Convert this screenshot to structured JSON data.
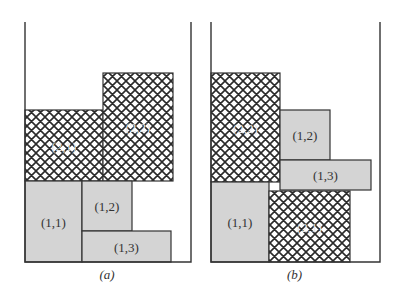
{
  "colors": {
    "gray_fill": "#d4d4d4",
    "stroke": "#333333",
    "hatch": "#2a2a2a",
    "background": "#ffffff"
  },
  "panels": [
    {
      "caption": "(a)",
      "container": {
        "left": 25,
        "right": 191,
        "top": 22,
        "bottom": 262
      },
      "blocks": [
        {
          "label": "(2,1)",
          "pattern": "crosshatch",
          "x": 25,
          "y": 110,
          "w": 78,
          "h": 71
        },
        {
          "label": "(2,2)",
          "pattern": "crosshatch",
          "x": 103,
          "y": 73,
          "w": 70,
          "h": 108
        },
        {
          "label": "(1,1)",
          "pattern": "gray",
          "x": 25,
          "y": 181,
          "w": 57,
          "h": 81
        },
        {
          "label": "(1,2)",
          "pattern": "gray",
          "x": 82,
          "y": 181,
          "w": 50,
          "h": 50
        },
        {
          "label": "(1,3)",
          "pattern": "gray",
          "x": 82,
          "y": 231,
          "w": 89,
          "h": 31
        }
      ]
    },
    {
      "caption": "(b)",
      "container": {
        "left": 211,
        "right": 380,
        "top": 22,
        "bottom": 262
      },
      "blocks": [
        {
          "label": "(2,2)",
          "pattern": "crosshatch",
          "x": 211,
          "y": 73,
          "w": 69,
          "h": 109
        },
        {
          "label": "(1,2)",
          "pattern": "gray",
          "x": 280,
          "y": 110,
          "w": 50,
          "h": 50
        },
        {
          "label": "(1,3)",
          "pattern": "gray",
          "x": 280,
          "y": 160,
          "w": 91,
          "h": 30
        },
        {
          "label": "(1,1)",
          "pattern": "gray",
          "x": 211,
          "y": 182,
          "w": 58,
          "h": 80
        },
        {
          "label": "(2,1)",
          "pattern": "crosshatch",
          "x": 269,
          "y": 191,
          "w": 81,
          "h": 71
        }
      ]
    }
  ]
}
